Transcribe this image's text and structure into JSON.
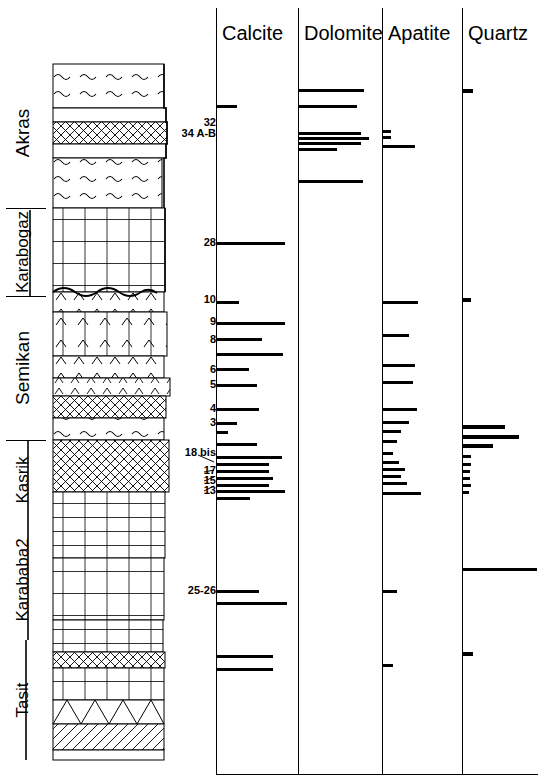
{
  "figure": {
    "type": "stratigraphic-mineralogy-log",
    "width": 539,
    "height": 782,
    "ink": "#000000",
    "paper": "#ffffff"
  },
  "formations": [
    {
      "name": "Akras",
      "top": 58,
      "bottom": 208
    },
    {
      "name": "Karabogaz",
      "top": 208,
      "bottom": 296
    },
    {
      "name": "Semikan",
      "top": 296,
      "bottom": 440
    },
    {
      "name": "Kasrik",
      "top": 440,
      "bottom": 520
    },
    {
      "name": "Karababa2",
      "top": 520,
      "bottom": 640
    },
    {
      "name": "Tasit",
      "top": 640,
      "bottom": 760
    }
  ],
  "lithology": {
    "beds": [
      {
        "top": 64,
        "height": 44,
        "pattern": "wavy",
        "right": 112
      },
      {
        "top": 108,
        "height": 14,
        "pattern": "blank",
        "right": 114
      },
      {
        "top": 122,
        "height": 22,
        "pattern": "crosshatch",
        "right": 115
      },
      {
        "top": 144,
        "height": 14,
        "pattern": "blank",
        "right": 114
      },
      {
        "top": 158,
        "height": 50,
        "pattern": "wavy",
        "right": 110
      },
      {
        "top": 208,
        "height": 84,
        "pattern": "brick",
        "right": 113
      },
      {
        "top": 292,
        "height": 20,
        "pattern": "wavy-top",
        "right": 112
      },
      {
        "top": 312,
        "height": 44,
        "pattern": "brick-chev",
        "right": 115
      },
      {
        "top": 356,
        "height": 22,
        "pattern": "chevron",
        "right": 112
      },
      {
        "top": 378,
        "height": 18,
        "pattern": "crosshatch",
        "right": 118
      },
      {
        "top": 396,
        "height": 22,
        "pattern": "chevron-row",
        "right": 114
      },
      {
        "top": 418,
        "height": 22,
        "pattern": "wavy",
        "right": 112
      },
      {
        "top": 440,
        "height": 52,
        "pattern": "crosshatch",
        "right": 117
      },
      {
        "top": 492,
        "height": 66,
        "pattern": "brick",
        "right": 113
      },
      {
        "top": 558,
        "height": 62,
        "pattern": "brick-tall",
        "right": 112
      },
      {
        "top": 620,
        "height": 32,
        "pattern": "brick",
        "right": 111
      },
      {
        "top": 652,
        "height": 16,
        "pattern": "crosshatch",
        "right": 113
      },
      {
        "top": 668,
        "height": 32,
        "pattern": "blank",
        "right": 112
      },
      {
        "top": 700,
        "height": 24,
        "pattern": "triangle",
        "right": 112
      },
      {
        "top": 724,
        "height": 26,
        "pattern": "slant",
        "right": 112
      },
      {
        "top": 750,
        "height": 10,
        "pattern": "blank",
        "right": 112
      }
    ]
  },
  "sample_labels": [
    {
      "text": "32",
      "y": 122
    },
    {
      "text": "34 A-B",
      "y": 132
    },
    {
      "text": "28",
      "y": 242
    },
    {
      "text": "10",
      "y": 299
    },
    {
      "text": "9",
      "y": 321
    },
    {
      "text": "8",
      "y": 339
    },
    {
      "text": "6",
      "y": 369
    },
    {
      "text": "5",
      "y": 384
    },
    {
      "text": "4",
      "y": 408
    },
    {
      "text": "3",
      "y": 422
    },
    {
      "text": "18 bis",
      "y": 452
    },
    {
      "text": "17",
      "y": 470
    },
    {
      "text": "15",
      "y": 480
    },
    {
      "text": "13",
      "y": 490
    },
    {
      "text": "25-26",
      "y": 590
    }
  ],
  "chart_data": {
    "type": "bar",
    "orientation": "horizontal",
    "title": "",
    "xlabel": "relative abundance",
    "ylabel": "stratigraphic depth",
    "grid": false,
    "legend": "none",
    "panels": [
      {
        "name": "Calcite",
        "left": 216,
        "width": 82,
        "bars": [
          {
            "y": 105,
            "len": 20,
            "thick": 3
          },
          {
            "y": 242,
            "len": 68,
            "thick": 3
          },
          {
            "y": 301,
            "len": 22,
            "thick": 3
          },
          {
            "y": 322,
            "len": 68,
            "thick": 3
          },
          {
            "y": 338,
            "len": 45,
            "thick": 3
          },
          {
            "y": 353,
            "len": 66,
            "thick": 3
          },
          {
            "y": 368,
            "len": 32,
            "thick": 3
          },
          {
            "y": 384,
            "len": 40,
            "thick": 3
          },
          {
            "y": 408,
            "len": 42,
            "thick": 3
          },
          {
            "y": 422,
            "len": 20,
            "thick": 3
          },
          {
            "y": 431,
            "len": 11,
            "thick": 3
          },
          {
            "y": 443,
            "len": 40,
            "thick": 3
          },
          {
            "y": 456,
            "len": 65,
            "thick": 3
          },
          {
            "y": 463,
            "len": 52,
            "thick": 3
          },
          {
            "y": 470,
            "len": 52,
            "thick": 3
          },
          {
            "y": 477,
            "len": 56,
            "thick": 3
          },
          {
            "y": 484,
            "len": 52,
            "thick": 3
          },
          {
            "y": 490,
            "len": 68,
            "thick": 3
          },
          {
            "y": 497,
            "len": 33,
            "thick": 3
          },
          {
            "y": 590,
            "len": 42,
            "thick": 3
          },
          {
            "y": 602,
            "len": 70,
            "thick": 3
          },
          {
            "y": 655,
            "len": 56,
            "thick": 3
          },
          {
            "y": 668,
            "len": 56,
            "thick": 3
          }
        ]
      },
      {
        "name": "Dolomite",
        "left": 298,
        "width": 82,
        "bars": [
          {
            "y": 89,
            "len": 65,
            "thick": 3
          },
          {
            "y": 105,
            "len": 58,
            "thick": 3
          },
          {
            "y": 132,
            "len": 62,
            "thick": 3
          },
          {
            "y": 137,
            "len": 70,
            "thick": 3
          },
          {
            "y": 142,
            "len": 62,
            "thick": 3
          },
          {
            "y": 148,
            "len": 38,
            "thick": 3
          },
          {
            "y": 180,
            "len": 64,
            "thick": 3
          }
        ]
      },
      {
        "name": "Apatite",
        "left": 382,
        "width": 78,
        "bars": [
          {
            "y": 130,
            "len": 8,
            "thick": 3
          },
          {
            "y": 136,
            "len": 8,
            "thick": 3
          },
          {
            "y": 145,
            "len": 32,
            "thick": 3
          },
          {
            "y": 301,
            "len": 35,
            "thick": 3
          },
          {
            "y": 334,
            "len": 26,
            "thick": 3
          },
          {
            "y": 364,
            "len": 32,
            "thick": 3
          },
          {
            "y": 381,
            "len": 30,
            "thick": 3
          },
          {
            "y": 408,
            "len": 34,
            "thick": 3
          },
          {
            "y": 421,
            "len": 26,
            "thick": 3
          },
          {
            "y": 430,
            "len": 18,
            "thick": 3
          },
          {
            "y": 440,
            "len": 14,
            "thick": 3
          },
          {
            "y": 452,
            "len": 10,
            "thick": 3
          },
          {
            "y": 461,
            "len": 16,
            "thick": 3
          },
          {
            "y": 468,
            "len": 22,
            "thick": 3
          },
          {
            "y": 475,
            "len": 18,
            "thick": 3
          },
          {
            "y": 482,
            "len": 24,
            "thick": 3
          },
          {
            "y": 492,
            "len": 38,
            "thick": 3
          },
          {
            "y": 590,
            "len": 14,
            "thick": 3
          },
          {
            "y": 664,
            "len": 10,
            "thick": 3
          }
        ]
      },
      {
        "name": "Quartz",
        "left": 462,
        "width": 77,
        "bars": [
          {
            "y": 89,
            "len": 10,
            "thick": 4
          },
          {
            "y": 298,
            "len": 8,
            "thick": 4
          },
          {
            "y": 425,
            "len": 42,
            "thick": 4
          },
          {
            "y": 435,
            "len": 56,
            "thick": 4
          },
          {
            "y": 444,
            "len": 30,
            "thick": 4
          },
          {
            "y": 455,
            "len": 8,
            "thick": 3
          },
          {
            "y": 463,
            "len": 8,
            "thick": 3
          },
          {
            "y": 470,
            "len": 7,
            "thick": 3
          },
          {
            "y": 477,
            "len": 7,
            "thick": 3
          },
          {
            "y": 484,
            "len": 8,
            "thick": 3
          },
          {
            "y": 491,
            "len": 6,
            "thick": 3
          },
          {
            "y": 568,
            "len": 74,
            "thick": 3
          },
          {
            "y": 652,
            "len": 10,
            "thick": 4
          }
        ]
      }
    ]
  }
}
